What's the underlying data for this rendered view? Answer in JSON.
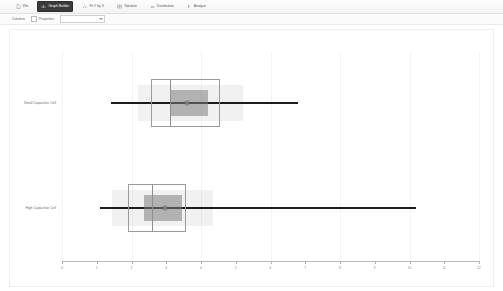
{
  "window": {
    "title": "Distribution"
  },
  "toolbar": {
    "items": [
      {
        "label": "File",
        "icon": "file-icon",
        "active": false
      },
      {
        "label": "Graph Builder",
        "icon": "chart-icon",
        "active": true
      },
      {
        "label": "Fit Y by X",
        "icon": "scatter-icon",
        "active": false
      },
      {
        "label": "Tabulate",
        "icon": "table-icon",
        "active": false
      },
      {
        "label": "Distribution",
        "icon": "histogram-icon",
        "active": false
      },
      {
        "label": "Analyze",
        "icon": "function-icon",
        "active": false
      }
    ]
  },
  "subbar": {
    "columns_label": "Columns",
    "properties_label": "Properties",
    "field_value": ""
  },
  "chart_data": {
    "type": "box",
    "title": "",
    "xlabel": "",
    "ylabel": "",
    "orientation": "horizontal",
    "grid": true,
    "legend": "none",
    "xlim": [
      0,
      12
    ],
    "xticks": [
      0,
      1,
      2,
      3,
      4,
      5,
      6,
      7,
      8,
      9,
      10,
      11,
      12
    ],
    "xticklabels": [
      "0",
      "1",
      "2",
      "3",
      "4",
      "5",
      "6",
      "7",
      "8",
      "9",
      "10",
      "11",
      "12"
    ],
    "categories": [
      "Small Capacitive Cell",
      "High Capacitive Cell"
    ],
    "series": [
      {
        "name": "Small Capacitive Cell",
        "min": 1.4,
        "q1": 2.55,
        "median": 3.12,
        "q3": 4.5,
        "max": 6.8,
        "mean": 3.6,
        "inner_low": 3.12,
        "inner_high": 4.2,
        "band_low": 2.2,
        "band_high": 5.2
      },
      {
        "name": "High Capacitive Cell",
        "min": 1.1,
        "q1": 1.9,
        "median": 2.6,
        "q3": 3.5,
        "max": 10.2,
        "mean": 2.95,
        "inner_low": 2.35,
        "inner_high": 3.45,
        "band_low": 1.45,
        "band_high": 4.35
      }
    ]
  }
}
